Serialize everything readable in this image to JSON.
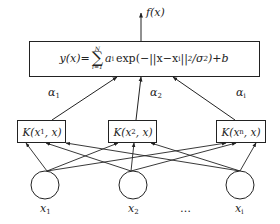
{
  "diagram": {
    "type": "rbf-network",
    "output_label": "f(x)",
    "summation_node": {
      "formula_text": "y(x)= Σ_{i=1}^{N} a_i exp(−||x−x_i||²/σ²)+b",
      "lhs": "y(x)=",
      "sum_upper": "N",
      "sum_lower": "i=1",
      "term": "a",
      "term_sub": "i",
      "exp_part": "exp(−||x−x",
      "exp_sub": "i",
      "exp_rest": "||",
      "exp_sup": "2",
      "div": "/σ",
      "div_sup": "2",
      "tail": ")+b"
    },
    "weights": [
      {
        "label": "α",
        "sub": "1"
      },
      {
        "label": "α",
        "sub": "2"
      },
      {
        "label": "α",
        "sub": "i"
      }
    ],
    "kernel_nodes": [
      {
        "pre": "K(x",
        "sub": "1",
        "post": ", x)"
      },
      {
        "pre": "K(x",
        "sub": "2",
        "post": ", x)"
      },
      {
        "pre": "K(x",
        "sub": "n",
        "post": ", x)"
      }
    ],
    "input_nodes": [
      {
        "label": "x",
        "sub": "1"
      },
      {
        "label": "x",
        "sub": "2"
      },
      {
        "label": "x",
        "sub": "i"
      }
    ],
    "ellipsis": "…"
  }
}
